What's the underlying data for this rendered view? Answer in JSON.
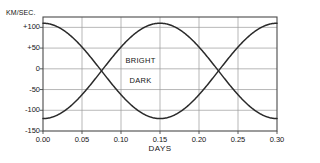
{
  "chart_data": {
    "type": "line",
    "title": "",
    "subtitle": "",
    "xlabel": "DAYS",
    "ylabel": "KM/SEC.",
    "xlim": [
      0.0,
      0.3
    ],
    "ylim": [
      -150,
      125
    ],
    "grid": true,
    "legend_position": "inline",
    "x_ticks": [
      "0.00",
      "0.05",
      "0.10",
      "0.15",
      "0.20",
      "0.25",
      "0.30"
    ],
    "x_tick_values": [
      0.0,
      0.05,
      0.1,
      0.15,
      0.2,
      0.25,
      0.3
    ],
    "y_ticks": [
      "+100",
      "+50",
      "0",
      "-50",
      "-100",
      "-150"
    ],
    "y_tick_values": [
      100,
      50,
      0,
      -50,
      -100,
      -150
    ],
    "annotations": [
      {
        "text": "BRIGHT",
        "x": 0.125,
        "y": 22
      },
      {
        "text": "DARK",
        "x": 0.125,
        "y": -26
      }
    ],
    "series": [
      {
        "name": "BRIGHT",
        "color": "#2a2a2a",
        "form": "sinusoid",
        "amplitude": 115,
        "offset": -5,
        "period": 0.3,
        "phase_days": 0.0,
        "x": [
          0.0,
          0.0125,
          0.025,
          0.0375,
          0.05,
          0.0625,
          0.075,
          0.0875,
          0.1,
          0.1125,
          0.125,
          0.1375,
          0.15,
          0.1625,
          0.175,
          0.1875,
          0.2,
          0.2125,
          0.225,
          0.2375,
          0.25,
          0.2625,
          0.275,
          0.2875,
          0.3
        ],
        "values": [
          -105,
          -112,
          -116,
          -114,
          -105,
          -92,
          -73,
          -51,
          -28,
          -5,
          18,
          40,
          60,
          78,
          92,
          102,
          108,
          110,
          108,
          101,
          90,
          75,
          56,
          34,
          10
        ]
      },
      {
        "name": "DARK",
        "color": "#2a2a2a",
        "form": "sinusoid",
        "amplitude": 115,
        "offset": -5,
        "period": 0.3,
        "phase_days": 0.15,
        "x": [
          0.0,
          0.0125,
          0.025,
          0.0375,
          0.05,
          0.0625,
          0.075,
          0.0875,
          0.1,
          0.1125,
          0.125,
          0.1375,
          0.15,
          0.1625,
          0.175,
          0.1875,
          0.2,
          0.2125,
          0.225,
          0.2375,
          0.25,
          0.2625,
          0.275,
          0.2875,
          0.3
        ],
        "values": [
          95,
          102,
          106,
          104,
          95,
          82,
          63,
          41,
          18,
          -5,
          -28,
          -50,
          -70,
          -88,
          -102,
          -112,
          -118,
          -120,
          -118,
          -111,
          -100,
          -85,
          -66,
          -44,
          -20
        ]
      }
    ]
  },
  "chart_meta": {
    "axis_color": "#4a4a4a",
    "grid_color": "#9a9a9a",
    "curve_color": "#2a2a2a",
    "background": "#ffffff",
    "plot_left": 43,
    "plot_right": 277,
    "plot_top": 17,
    "plot_bottom": 131
  }
}
